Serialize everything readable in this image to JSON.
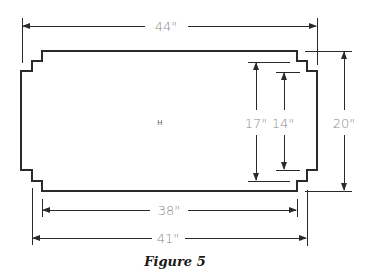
{
  "figure": {
    "caption": "Figure 5",
    "center_label": "H",
    "line_color": "#2a2a2a",
    "label_color": "#8a8a8a"
  },
  "dimensions": {
    "overall_width": "44\"",
    "inner_width": "38\"",
    "mid_width": "41\"",
    "overall_height": "20\"",
    "mid_height": "17\"",
    "inner_height": "14\""
  }
}
